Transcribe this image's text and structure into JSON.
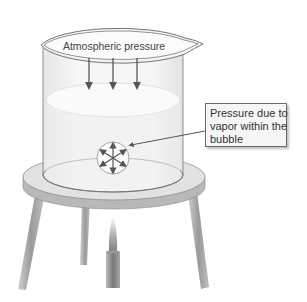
{
  "diagram": {
    "labels": {
      "atmospheric": "Atmospheric pressure",
      "callout_lines": [
        "Pressure due to",
        "vapor within the",
        "bubble"
      ]
    },
    "components": [
      "beaker",
      "liquid",
      "vapor-bubble",
      "ring-stand",
      "bunsen-burner",
      "flame"
    ],
    "colors": {
      "outline": "#555555",
      "beaker_fill": "#f2f2f2",
      "liquid_fill": "#ececec",
      "stand_top": "#dcdcdc",
      "stand_edge": "#9a9a9a",
      "legs": "#a8a8a8",
      "burner": "#8c8c8c",
      "arrow": "#555555",
      "callout_bg": "#f6f6f6"
    }
  }
}
